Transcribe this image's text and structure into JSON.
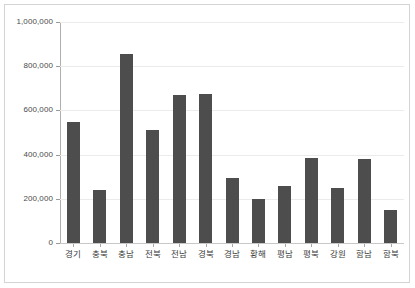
{
  "chart_data": {
    "type": "bar",
    "title": "",
    "subtitle": "",
    "xlabel": "",
    "ylabel": "",
    "categories": [
      "경기",
      "충북",
      "충남",
      "전북",
      "전남",
      "경북",
      "경남",
      "황해",
      "평남",
      "평북",
      "강원",
      "함남",
      "함북"
    ],
    "values": [
      547000,
      238000,
      855000,
      510000,
      670000,
      673000,
      295000,
      200000,
      260000,
      385000,
      247000,
      380000,
      150000
    ],
    "ylim": [
      0,
      1000000
    ],
    "yticks": [
      0,
      200000,
      400000,
      600000,
      800000,
      1000000
    ],
    "ytick_labels": [
      "0",
      "200,000",
      "400,000",
      "600,000",
      "800,000",
      "1,000,000"
    ],
    "grid": true,
    "legend": null,
    "legend_position": "none",
    "bar_color": "#4d4d4d",
    "grid_color": "#ebebeb",
    "axis_color": "#b0b0b0",
    "background_color": "#ffffff",
    "annotations": []
  }
}
